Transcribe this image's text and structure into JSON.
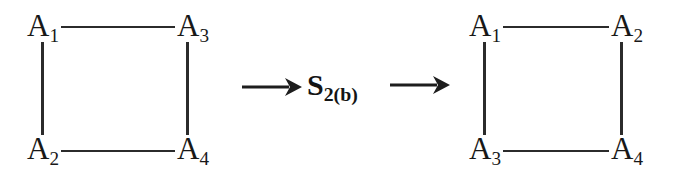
{
  "diagram": {
    "type": "graph-transformation",
    "stroke_color": "#2b2b2b",
    "text_color": "#181818",
    "background_color": "#ffffff"
  },
  "left_graph": {
    "name": "left-square-graph",
    "nodes": [
      {
        "id": "l-tl",
        "base": "A",
        "sub": "1",
        "position": "top-left"
      },
      {
        "id": "l-tr",
        "base": "A",
        "sub": "3",
        "position": "top-right"
      },
      {
        "id": "l-bl",
        "base": "A",
        "sub": "2",
        "position": "bottom-left"
      },
      {
        "id": "l-br",
        "base": "A",
        "sub": "4",
        "position": "bottom-right"
      }
    ],
    "edges": [
      {
        "id": "l-top",
        "from": "l-tl",
        "to": "l-tr",
        "orientation": "horizontal"
      },
      {
        "id": "l-bottom",
        "from": "l-bl",
        "to": "l-br",
        "orientation": "horizontal"
      },
      {
        "id": "l-left",
        "from": "l-tl",
        "to": "l-bl",
        "orientation": "vertical"
      },
      {
        "id": "l-right",
        "from": "l-tr",
        "to": "l-br",
        "orientation": "vertical"
      }
    ]
  },
  "operator": {
    "name": "permutation-operator",
    "base": "S",
    "sub": "2(b)",
    "full_label": "S2(b)",
    "arrow_before": "→",
    "arrow_after": "→"
  },
  "right_graph": {
    "name": "right-square-graph",
    "nodes": [
      {
        "id": "r-tl",
        "base": "A",
        "sub": "1",
        "position": "top-left"
      },
      {
        "id": "r-tr",
        "base": "A",
        "sub": "2",
        "position": "top-right"
      },
      {
        "id": "r-bl",
        "base": "A",
        "sub": "3",
        "position": "bottom-left"
      },
      {
        "id": "r-br",
        "base": "A",
        "sub": "4",
        "position": "bottom-right"
      }
    ],
    "edges": [
      {
        "id": "r-top",
        "from": "r-tl",
        "to": "r-tr",
        "orientation": "horizontal"
      },
      {
        "id": "r-bottom",
        "from": "r-bl",
        "to": "r-br",
        "orientation": "horizontal"
      },
      {
        "id": "r-left",
        "from": "r-tl",
        "to": "r-bl",
        "orientation": "vertical"
      },
      {
        "id": "r-right",
        "from": "r-tr",
        "to": "r-br",
        "orientation": "vertical"
      }
    ]
  }
}
